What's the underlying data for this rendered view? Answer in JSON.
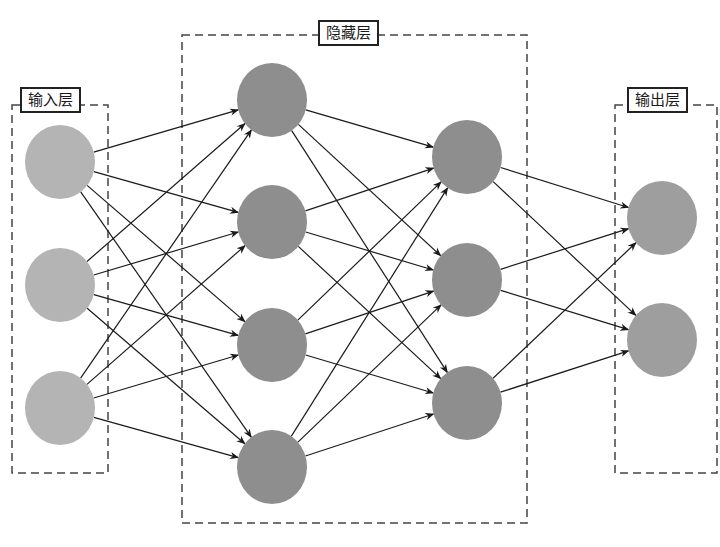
{
  "diagram": {
    "type": "neural-network",
    "colors": {
      "input_node": "#b4b4b4",
      "hidden_node": "#8e8e8e",
      "output_node": "#9e9e9e",
      "edge": "#1a1a1a",
      "box_border": "#444444"
    },
    "node_radius_x": 35,
    "node_radius_y": 37,
    "layers": [
      {
        "id": "input",
        "label": "输入层",
        "box": {
          "x": 12,
          "y": 105,
          "w": 96,
          "h": 368
        },
        "label_pos": {
          "x": 20,
          "y": 87
        },
        "color_key": "input_node",
        "nodes": [
          {
            "x": 60,
            "y": 162
          },
          {
            "x": 60,
            "y": 285
          },
          {
            "x": 60,
            "y": 408
          }
        ]
      },
      {
        "id": "hidden1",
        "label": "隐藏层",
        "box": {
          "x": 182,
          "y": 35,
          "w": 345,
          "h": 488
        },
        "label_pos": {
          "x": 318,
          "y": 20
        },
        "color_key": "hidden_node",
        "nodes": [
          {
            "x": 272,
            "y": 100
          },
          {
            "x": 272,
            "y": 222
          },
          {
            "x": 272,
            "y": 345
          },
          {
            "x": 272,
            "y": 467
          }
        ]
      },
      {
        "id": "hidden2",
        "label": "",
        "color_key": "hidden_node",
        "nodes": [
          {
            "x": 467,
            "y": 157
          },
          {
            "x": 467,
            "y": 280
          },
          {
            "x": 467,
            "y": 403
          }
        ]
      },
      {
        "id": "output",
        "label": "输出层",
        "box": {
          "x": 615,
          "y": 105,
          "w": 102,
          "h": 368
        },
        "label_pos": {
          "x": 627,
          "y": 87
        },
        "color_key": "output_node",
        "nodes": [
          {
            "x": 662,
            "y": 218
          },
          {
            "x": 662,
            "y": 340
          }
        ]
      }
    ],
    "connections": "fully-connected-between-consecutive-layers"
  },
  "labels": {
    "input": "输入层",
    "hidden": "隐藏层",
    "output": "输出层"
  }
}
